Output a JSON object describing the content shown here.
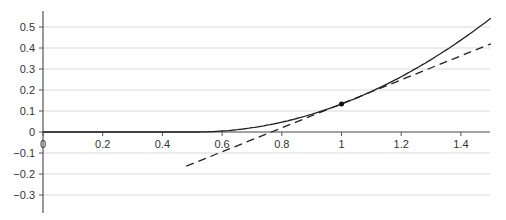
{
  "chart_data": {
    "type": "line",
    "title": "",
    "xlabel": "",
    "ylabel": "",
    "xlim": [
      0,
      1.5
    ],
    "ylim": [
      -0.35,
      0.55
    ],
    "grid": {
      "horizontal": true,
      "vertical": false
    },
    "legend": null,
    "x_ticks": [
      0,
      0.2,
      0.4,
      0.6,
      0.8,
      1,
      1.2,
      1.4
    ],
    "x_tick_labels": [
      "0",
      "0.2",
      "0.4",
      "0.6",
      "0.8",
      "1",
      "1.2",
      "1.4"
    ],
    "y_ticks": [
      0.5,
      0.4,
      0.3,
      0.2,
      0.1,
      0,
      -0.1,
      -0.2,
      -0.3
    ],
    "y_tick_labels": [
      "0.5",
      "0.4",
      "0.3",
      "0.2",
      "0.1",
      "0",
      "−0.1",
      "−0.2",
      "−0.3"
    ],
    "series": [
      {
        "name": "function",
        "style": "solid",
        "x": [
          0,
          0.2,
          0.4,
          0.5,
          0.55,
          0.6,
          0.7,
          0.8,
          0.9,
          1.0,
          1.1,
          1.2,
          1.3,
          1.4,
          1.5
        ],
        "y": [
          0,
          0,
          0,
          0,
          0.001,
          0.004,
          0.02,
          0.047,
          0.085,
          0.133,
          0.193,
          0.264,
          0.346,
          0.438,
          0.54
        ]
      },
      {
        "name": "tangent line at x=1",
        "style": "dashed",
        "x": [
          0.48,
          1.5
        ],
        "y": [
          -0.163,
          0.42
        ]
      }
    ],
    "annotations": [
      {
        "type": "point",
        "x": 1.0,
        "y": 0.133,
        "label": ""
      }
    ]
  }
}
